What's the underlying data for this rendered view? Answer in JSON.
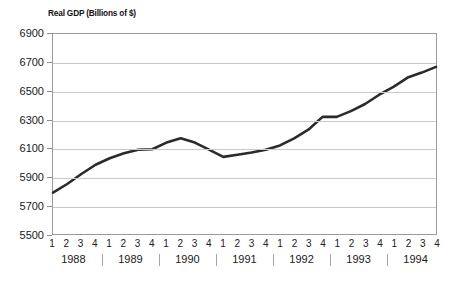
{
  "chart_data": {
    "type": "line",
    "title": "Real GDP (Billions of $)",
    "xlabel": "",
    "ylabel": "",
    "ylim": [
      5500,
      6900
    ],
    "yticks": [
      5500,
      5700,
      5900,
      6100,
      6300,
      6500,
      6700,
      6900
    ],
    "grid": true,
    "legend": null,
    "line_color": "#2b2b2b",
    "categories": [
      "1988 Q1",
      "1988 Q2",
      "1988 Q3",
      "1988 Q4",
      "1989 Q1",
      "1989 Q2",
      "1989 Q3",
      "1989 Q4",
      "1990 Q1",
      "1990 Q2",
      "1990 Q3",
      "1990 Q4",
      "1991 Q1",
      "1991 Q2",
      "1991 Q3",
      "1991 Q4",
      "1992 Q1",
      "1992 Q2",
      "1992 Q3",
      "1992 Q4",
      "1993 Q1",
      "1993 Q2",
      "1993 Q3",
      "1993 Q4",
      "1994 Q1",
      "1994 Q2",
      "1994 Q3",
      "1994 Q4"
    ],
    "quarter_labels": [
      "1",
      "2",
      "3",
      "4",
      "1",
      "2",
      "3",
      "4",
      "1",
      "2",
      "3",
      "4",
      "1",
      "2",
      "3",
      "4",
      "1",
      "2",
      "3",
      "4",
      "1",
      "2",
      "3",
      "4",
      "1",
      "2",
      "3",
      "4"
    ],
    "year_labels": [
      "1988",
      "1989",
      "1990",
      "1991",
      "1992",
      "1993",
      "1994"
    ],
    "values": [
      5790,
      5850,
      5920,
      5985,
      6030,
      6065,
      6090,
      6093,
      6140,
      6170,
      6140,
      6090,
      6040,
      6055,
      6070,
      6090,
      6120,
      6170,
      6230,
      6320,
      6320,
      6360,
      6410,
      6475,
      6530,
      6595,
      6630,
      6670
    ]
  }
}
